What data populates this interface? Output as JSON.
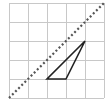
{
  "diagram": {
    "type": "grid-geometry",
    "grid": {
      "cols": 5,
      "rows": 5,
      "origin_px": [
        9,
        98
      ],
      "cell_px": 19,
      "line_color": "#c8c8c8"
    },
    "reflection_line": {
      "style": "dotted",
      "from": [
        0,
        0
      ],
      "to": [
        5,
        5
      ],
      "color": "#555555",
      "description": "diagonal line y = x"
    },
    "triangle": {
      "vertices": [
        [
          2,
          1
        ],
        [
          3,
          1
        ],
        [
          4,
          3
        ]
      ],
      "stroke": "#222222",
      "fill": "none"
    }
  }
}
